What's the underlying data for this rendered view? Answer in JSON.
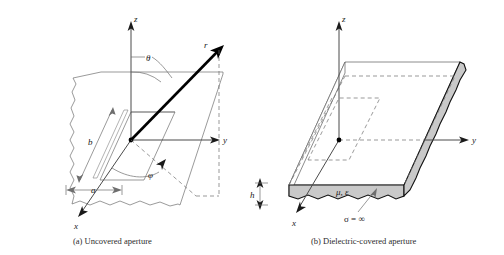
{
  "figure": {
    "background_color": "#ffffff",
    "line_color": "#6e6e6e",
    "slab_fill_color": "#c9c9c9",
    "vector_color": "#000000"
  },
  "panels": [
    {
      "id": "a",
      "caption": "(a) Uncovered aperture",
      "axes": [
        {
          "name": "z-axis",
          "label": "z",
          "direction": "up"
        },
        {
          "name": "y-axis",
          "label": "y",
          "direction": "right"
        },
        {
          "name": "x-axis",
          "label": "x",
          "direction": "down-left"
        }
      ],
      "annotations": [
        {
          "name": "radial-vector",
          "label": "r"
        },
        {
          "name": "polar-angle",
          "label": "θ"
        },
        {
          "name": "azimuthal-angle",
          "label": "φ"
        },
        {
          "name": "aperture-width",
          "label": "a"
        },
        {
          "name": "aperture-length",
          "label": "b"
        }
      ]
    },
    {
      "id": "b",
      "caption": "(b) Dielectric-covered aperture",
      "axes": [
        {
          "name": "z-axis",
          "label": "z",
          "direction": "up"
        },
        {
          "name": "y-axis",
          "label": "y",
          "direction": "right"
        },
        {
          "name": "x-axis",
          "label": "x",
          "direction": "down-left"
        }
      ],
      "annotations": [
        {
          "name": "slab-thickness",
          "label": "h"
        },
        {
          "name": "material-parameters",
          "label": "μ, ε"
        },
        {
          "name": "conductivity",
          "label": "σ = ∞"
        }
      ]
    }
  ]
}
